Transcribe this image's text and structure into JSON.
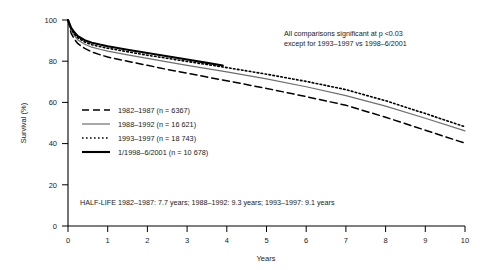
{
  "chart_data": {
    "type": "line",
    "title": "",
    "xlabel": "Years",
    "ylabel": "Survival (%)",
    "xlim": [
      0,
      10
    ],
    "ylim": [
      0,
      100
    ],
    "xticks": [
      "0",
      "1",
      "2",
      "3",
      "4",
      "5",
      "6",
      "7",
      "8",
      "9",
      "10"
    ],
    "yticks": [
      "0",
      "20",
      "40",
      "60",
      "80",
      "100"
    ],
    "grid": false,
    "legend_position": "center-left",
    "series": [
      {
        "name": "1982–1987 (n = 6367)",
        "period": "1982–1987",
        "n": "6367",
        "style": "dashed",
        "color": "#000000",
        "x": [
          0,
          0.08,
          0.17,
          0.25,
          0.42,
          0.6,
          0.8,
          1,
          1.5,
          2,
          2.5,
          3,
          3.5,
          4,
          5,
          6,
          7,
          8,
          9,
          10
        ],
        "y": [
          100,
          93.5,
          90.5,
          88.5,
          86.2,
          84.5,
          83.2,
          82.0,
          80.0,
          78.0,
          76.0,
          74.2,
          72.3,
          70.5,
          66.8,
          62.8,
          58.6,
          52.8,
          46.5,
          40.2
        ]
      },
      {
        "name": "1988–1992 (n = 16 621)",
        "period": "1988–1992",
        "n": "16 621",
        "style": "solid-thin",
        "color": "#6e6e6e",
        "x": [
          0,
          0.08,
          0.17,
          0.25,
          0.42,
          0.6,
          0.8,
          1,
          1.5,
          2,
          2.5,
          3,
          3.5,
          4,
          5,
          6,
          7,
          8,
          9,
          10
        ],
        "y": [
          100,
          94.8,
          92.2,
          90.3,
          88.2,
          86.8,
          85.8,
          84.9,
          83.1,
          81.4,
          79.7,
          78.0,
          76.4,
          74.8,
          71.4,
          67.6,
          63.3,
          58.2,
          52.3,
          46.2
        ]
      },
      {
        "name": "1993–1997 (n = 18 743)",
        "period": "1993–1997",
        "n": "18 743",
        "style": "dotted",
        "color": "#000000",
        "x": [
          0,
          0.08,
          0.17,
          0.25,
          0.42,
          0.6,
          0.8,
          1,
          1.5,
          2,
          2.5,
          3,
          3.5,
          4,
          5,
          6,
          7,
          8,
          9,
          10
        ],
        "y": [
          100,
          95.5,
          93.0,
          91.3,
          89.3,
          88.0,
          87.1,
          86.3,
          84.6,
          82.9,
          81.4,
          79.9,
          78.4,
          76.9,
          73.7,
          70.2,
          66.2,
          60.8,
          54.6,
          48.2
        ]
      },
      {
        "name": "1/1998–6/2001 (n = 10 678)",
        "period": "1/1998–6/2001",
        "n": "10 678",
        "style": "solid-thick",
        "color": "#000000",
        "x": [
          0,
          0.08,
          0.17,
          0.25,
          0.42,
          0.6,
          0.8,
          1,
          1.5,
          2,
          2.5,
          3,
          3.5,
          3.9
        ],
        "y": [
          100,
          96.2,
          93.8,
          92.1,
          90.2,
          89.0,
          88.1,
          87.3,
          85.6,
          84.0,
          82.4,
          80.8,
          79.2,
          77.9
        ]
      }
    ],
    "annotations": {
      "significance_line1": "All comparisons significant at p <0.03",
      "significance_line2": "except for 1993–1997 vs 1998–6/2001",
      "half_life": "HALF-LIFE 1982–1987: 7.7 years; 1988–1992: 9.3 years; 1993–1997: 9.1 years"
    }
  }
}
